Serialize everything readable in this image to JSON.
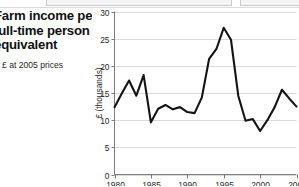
{
  "caption": {
    "title_line_1": "Farm income per",
    "title_line_2": "full-time person",
    "title_line_3": "equivalent",
    "subtitle": "£ at 2005 prices",
    "legend_swatch_color": "#1c1c1c"
  },
  "chart_data": {
    "type": "line",
    "title": "Farm income per full-time person equivalent",
    "subtitle": "£ at 2005 prices",
    "xlabel": "",
    "ylabel": "£ (thousands)",
    "xlim": [
      1980,
      2005
    ],
    "ylim": [
      0,
      30
    ],
    "grid": true,
    "legend_position": "none",
    "line_color": "#141414",
    "ytick_labels": [
      "0",
      "5",
      "10",
      "15",
      "20",
      "25",
      "30"
    ],
    "yticks": [
      0,
      5,
      10,
      15,
      20,
      25,
      30
    ],
    "xtick_labels": [
      "1980",
      "1985",
      "1990",
      "1995",
      "2000",
      "2005"
    ],
    "xticks": [
      1980,
      1985,
      1990,
      1995,
      2000,
      2005
    ],
    "series": [
      {
        "name": "Farm income per full-time person equivalent",
        "x": [
          1980,
          1981,
          1982,
          1983,
          1984,
          1985,
          1986,
          1987,
          1988,
          1989,
          1990,
          1991,
          1992,
          1993,
          1994,
          1995,
          1996,
          1997,
          1998,
          1999,
          2000,
          2001,
          2002,
          2003,
          2004,
          2005
        ],
        "values": [
          12.4,
          14.9,
          17.3,
          14.5,
          18.3,
          9.6,
          12.1,
          12.8,
          12.0,
          12.4,
          11.5,
          11.3,
          14.2,
          21.3,
          23.1,
          27.0,
          24.8,
          14.5,
          9.9,
          10.2,
          8.0,
          10.0,
          12.4,
          15.6,
          14.0,
          12.5
        ]
      }
    ]
  }
}
